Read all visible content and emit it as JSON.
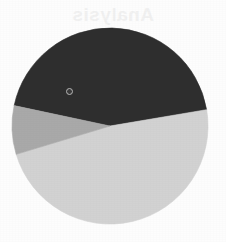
{
  "page": {
    "background_color": "#fdfdfd",
    "width": 226,
    "height": 242,
    "ghost_text": "Analysis"
  },
  "chart_data": {
    "type": "pie",
    "title": "",
    "subtitle": "",
    "xlabel": "",
    "ylabel": "",
    "legend_position": "none",
    "grid": false,
    "labels": [
      "Segment 1",
      "Segment 2",
      "Segment 3"
    ],
    "values": [
      44,
      48,
      8
    ],
    "units": "percent",
    "colors": [
      "#2e2e2e",
      "#d2d2d2",
      "#a9a9a9"
    ],
    "start_angle_deg": 192,
    "direction": "clockwise",
    "slices": [
      {
        "label": "Segment 1",
        "value": 44,
        "color": "#2e2e2e",
        "start_angle_deg": 192,
        "end_angle_deg": 350,
        "shade": "dark"
      },
      {
        "label": "Segment 2",
        "value": 48,
        "color": "#d2d2d2",
        "start_angle_deg": 350,
        "end_angle_deg": 163,
        "shade": "light"
      },
      {
        "label": "Segment 3",
        "value": 8,
        "color": "#a9a9a9",
        "start_angle_deg": 163,
        "end_angle_deg": 192,
        "shade": "medium"
      }
    ],
    "geometry": {
      "center_x": 110,
      "center_y": 126,
      "radius": 98
    },
    "marker": {
      "name": "slice-marker",
      "x": 69,
      "y": 91,
      "color": "#b9b9b9",
      "on_slice": "Segment 1"
    }
  }
}
